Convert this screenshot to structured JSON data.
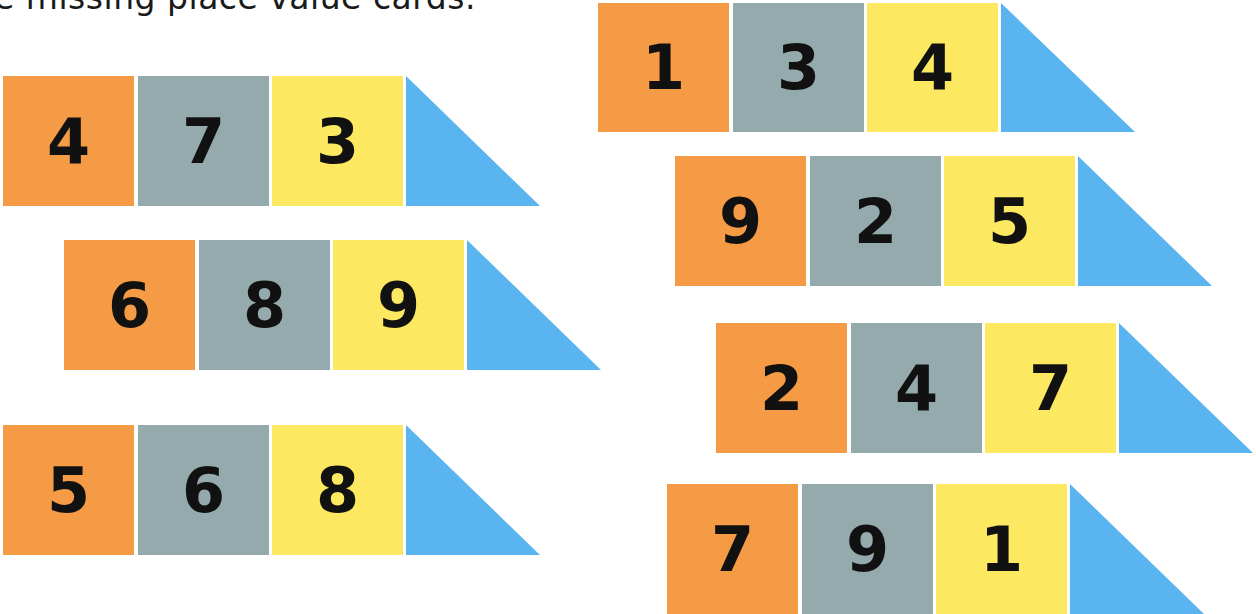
{
  "instruction": "e missing place value cards.",
  "colors": {
    "hundreds": "#F59A45",
    "tens": "#95AAAC",
    "ones": "#FCE861",
    "missing": "#5AB4EF"
  },
  "rows": [
    {
      "id": "left-1",
      "hundreds": "4",
      "tens": "7",
      "ones": "3",
      "missing": ""
    },
    {
      "id": "left-2",
      "hundreds": "6",
      "tens": "8",
      "ones": "9",
      "missing": ""
    },
    {
      "id": "left-3",
      "hundreds": "5",
      "tens": "6",
      "ones": "8",
      "missing": ""
    },
    {
      "id": "right-1",
      "hundreds": "1",
      "tens": "3",
      "ones": "4",
      "missing": ""
    },
    {
      "id": "right-2",
      "hundreds": "9",
      "tens": "2",
      "ones": "5",
      "missing": ""
    },
    {
      "id": "right-3",
      "hundreds": "2",
      "tens": "4",
      "ones": "7",
      "missing": ""
    },
    {
      "id": "right-4",
      "hundreds": "7",
      "tens": "9",
      "ones": "1",
      "missing": ""
    }
  ]
}
